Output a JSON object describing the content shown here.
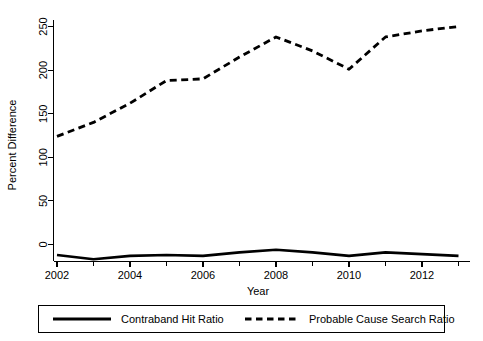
{
  "chart_data": {
    "type": "line",
    "title": "",
    "xlabel": "Year",
    "ylabel": "Percent Difference",
    "x": [
      2002,
      2003,
      2004,
      2005,
      2006,
      2007,
      2008,
      2009,
      2010,
      2011,
      2012,
      2013
    ],
    "xlim": [
      2002,
      2013
    ],
    "ylim": [
      -25,
      262
    ],
    "xticks": [
      2002,
      2004,
      2006,
      2008,
      2010,
      2012
    ],
    "xtick_labels": [
      "2002",
      "2004",
      "2006",
      "2008",
      "2010",
      "2012"
    ],
    "xticks_minor": [
      2003,
      2005,
      2007,
      2009,
      2011,
      2013
    ],
    "yticks": [
      0,
      50,
      100,
      150,
      200,
      250
    ],
    "ytick_labels": [
      "0",
      "50",
      "100",
      "150",
      "200",
      "250"
    ],
    "grid": false,
    "legend_position": "bottom",
    "series": [
      {
        "name": "Contraband Hit Ratio",
        "style": "solid",
        "color": "#000000",
        "values": [
          -12,
          -17,
          -13,
          -12,
          -13,
          -9,
          -6,
          -9,
          -13,
          -9,
          -11,
          -13
        ]
      },
      {
        "name": "Probable Cause Search Ratio",
        "style": "dashed",
        "color": "#000000",
        "values": [
          124,
          140,
          162,
          188,
          190,
          215,
          238,
          222,
          201,
          238,
          245,
          250
        ]
      }
    ]
  },
  "axes": {
    "y_title": "Percent Difference",
    "x_title": "Year"
  },
  "legend": {
    "items": [
      {
        "label": "Contraband Hit Ratio",
        "style": "solid"
      },
      {
        "label": "Probable Cause Search Ratio",
        "style": "dashed"
      }
    ]
  }
}
